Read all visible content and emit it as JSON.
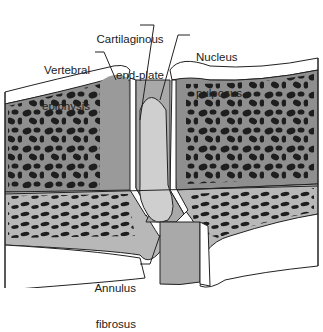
{
  "diagram": {
    "labels": {
      "cartilaginous_end_plate": [
        "Cartilaginous",
        "end-plate"
      ],
      "vertebral_epiphysis": [
        "Vertebral",
        "epiphysis"
      ],
      "nucleus_pulposus": [
        "Nucleus",
        "pulposus"
      ],
      "annulus_fibrosus": [
        "Annulus",
        "fibrosus"
      ]
    },
    "colors": {
      "outline": "#222222",
      "bone_dark_band": "#8f8f8f",
      "bone_light_band": "#b8b8b8",
      "trabecula": "#1e1e1e",
      "nucleus": "#cfcfcf",
      "annulus": "#a9a9a9",
      "end_plate": "#ffffff",
      "epiphysis": "#9a9a9a",
      "background": "#ffffff"
    }
  }
}
